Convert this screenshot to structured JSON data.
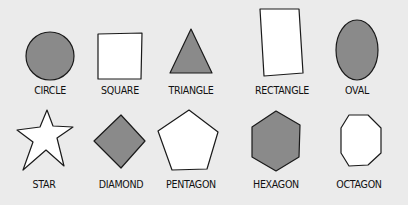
{
  "colors": {
    "background": "#ebebeb",
    "filled": "#8a8a8a",
    "empty": "#ffffff",
    "stroke": "#1a1a1a"
  },
  "shapes": [
    {
      "name": "circle",
      "label": "CIRCLE",
      "filled": true
    },
    {
      "name": "square",
      "label": "SQUARE",
      "filled": false
    },
    {
      "name": "triangle",
      "label": "TRIANGLE",
      "filled": true
    },
    {
      "name": "rectangle",
      "label": "RECTANGLE",
      "filled": false
    },
    {
      "name": "oval",
      "label": "OVAL",
      "filled": true
    },
    {
      "name": "star",
      "label": "STAR",
      "filled": false
    },
    {
      "name": "diamond",
      "label": "DIAMOND",
      "filled": true
    },
    {
      "name": "pentagon",
      "label": "PENTAGON",
      "filled": false
    },
    {
      "name": "hexagon",
      "label": "HEXAGON",
      "filled": true
    },
    {
      "name": "octagon",
      "label": "OCTAGON",
      "filled": false
    }
  ]
}
